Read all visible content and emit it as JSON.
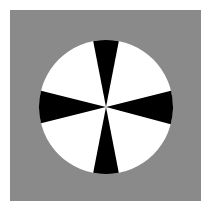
{
  "page": {
    "width": 211,
    "height": 223,
    "background_color": "#ffffff"
  },
  "panel": {
    "name": "gray-plot-panel",
    "x": 10,
    "y": 10,
    "width": 191,
    "height": 191,
    "fill_color": "#8a8a8a"
  },
  "chart_data": {
    "type": "pie",
    "title": "",
    "subtitle": "",
    "xlabel": "",
    "ylabel": "",
    "grid": false,
    "legend": "none",
    "circle": {
      "center_x": 106,
      "center_y": 107,
      "radius": 67,
      "base_fill": "#ffffff",
      "wedge_fill": "#000000"
    },
    "categories": [
      "top-black-wedge",
      "upper-right-white-wedge",
      "right-black-wedge",
      "lower-right-white-wedge",
      "bottom-black-wedge",
      "lower-left-white-wedge",
      "left-black-wedge",
      "upper-left-white-wedge"
    ],
    "values": [
      22,
      61,
      29,
      61,
      22,
      61,
      29,
      61
    ],
    "colors": [
      "#000000",
      "#ffffff",
      "#000000",
      "#ffffff",
      "#000000",
      "#ffffff",
      "#000000",
      "#ffffff"
    ],
    "wedges": [
      {
        "label": "top-black-wedge",
        "start_deg": -101,
        "end_deg": -79,
        "color": "#000000"
      },
      {
        "label": "right-black-wedge",
        "start_deg": -14,
        "end_deg": 15,
        "color": "#000000"
      },
      {
        "label": "bottom-black-wedge",
        "start_deg": 79,
        "end_deg": 101,
        "color": "#000000"
      },
      {
        "label": "left-black-wedge",
        "start_deg": 166,
        "end_deg": 194,
        "color": "#000000"
      }
    ],
    "angle_units": "degrees-clockwise-from-positive-x-axis",
    "ylim": [
      0,
      360
    ]
  }
}
